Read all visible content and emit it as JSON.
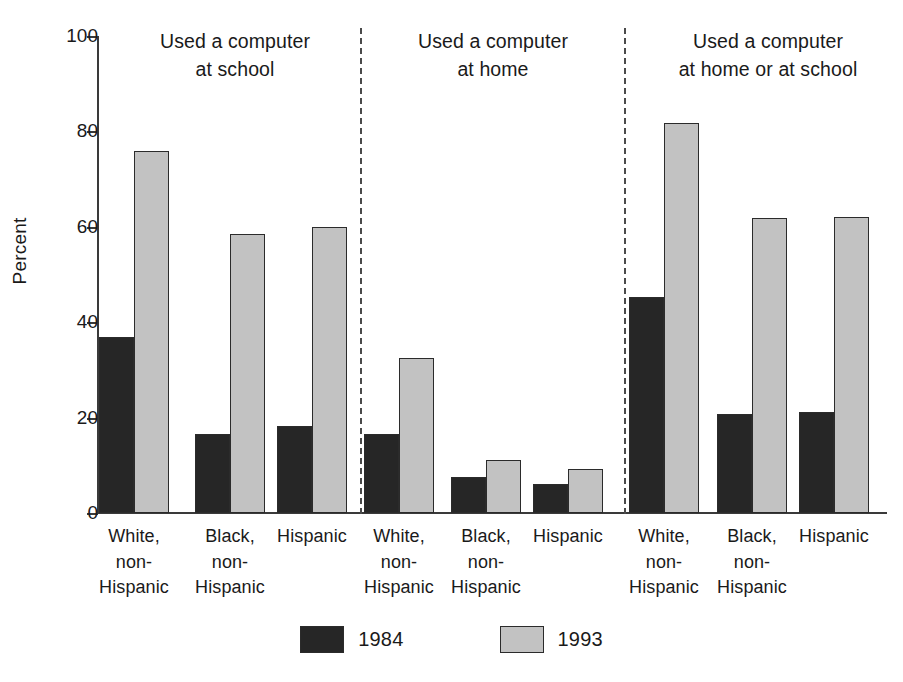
{
  "chart_data": {
    "type": "bar",
    "title": "",
    "xlabel": "",
    "ylabel": "Percent",
    "ylim": [
      0,
      100
    ],
    "yticks": [
      0,
      20,
      40,
      60,
      80,
      100
    ],
    "grid": false,
    "legend_position": "bottom-center",
    "categories": [
      "White, non-Hispanic",
      "Black, non-Hispanic",
      "Hispanic"
    ],
    "series": [
      {
        "name": "1984",
        "color": "#262626"
      },
      {
        "name": "1993",
        "color": "#c2c2c2"
      }
    ],
    "panels": [
      {
        "title": "Used a computer\nat school",
        "title_line1": "Used a computer",
        "title_line2": "at school",
        "values": {
          "1984": [
            37.0,
            16.6,
            18.2
          ],
          "1993": [
            75.8,
            58.4,
            59.9
          ]
        }
      },
      {
        "title": "Used a computer\nat home",
        "title_line1": "Used a computer",
        "title_line2": "at home",
        "values": {
          "1984": [
            16.6,
            7.5,
            6.0
          ],
          "1993": [
            32.5,
            11.1,
            9.3
          ]
        }
      },
      {
        "title": "Used a computer\nat home or at school",
        "title_line1": "Used a computer",
        "title_line2": "at home or at school",
        "values": {
          "1984": [
            45.3,
            20.8,
            21.2
          ],
          "1993": [
            81.7,
            61.8,
            62.0
          ]
        }
      }
    ]
  },
  "axis": {
    "y_label": "Percent",
    "ticks": [
      "0",
      "20",
      "40",
      "60",
      "80",
      "100"
    ]
  },
  "category_labels": [
    {
      "line1": "White,",
      "line2": "non-",
      "line3": "Hispanic"
    },
    {
      "line1": "Black,",
      "line2": "non-",
      "line3": "Hispanic"
    },
    {
      "line1": "Hispanic",
      "line2": "",
      "line3": ""
    }
  ],
  "legend": {
    "items": [
      {
        "label": "1984"
      },
      {
        "label": "1993"
      }
    ]
  }
}
